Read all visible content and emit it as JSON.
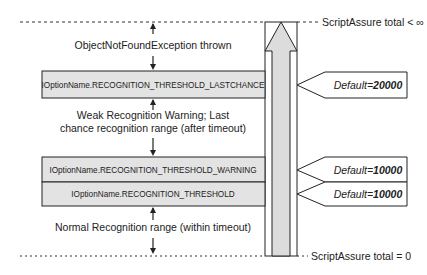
{
  "diagram": {
    "top_boundary": {
      "label": "ScriptAssure total < ∞"
    },
    "bottom_boundary": {
      "label": "ScriptAssure total = 0"
    },
    "regions": [
      {
        "name": "exception",
        "lines": [
          "ObjectNotFoundException thrown"
        ]
      },
      {
        "name": "weak",
        "lines": [
          "Weak Recognition Warning; Last",
          "chance recognition range (after timeout)"
        ]
      },
      {
        "name": "normal",
        "lines": [
          "Normal Recognition range (within timeout)"
        ]
      }
    ],
    "thresholds": [
      {
        "label": "IOptionName.RECOGNITION_THRESHOLD_LASTCHANCE",
        "default_prefix": "Default=",
        "default_value": "20000"
      },
      {
        "label": "IOptionName.RECOGNITION_THRESHOLD_WARNING",
        "default_prefix": "Default=",
        "default_value": "10000"
      },
      {
        "label": "IOptionName.RECOGNITION_THRESHOLD",
        "default_prefix": "Default=",
        "default_value": "10000"
      }
    ],
    "colors": {
      "box_fill": "#e3e3e3",
      "arrow_fill": "#dcdcdc",
      "stroke": "#222222"
    }
  }
}
